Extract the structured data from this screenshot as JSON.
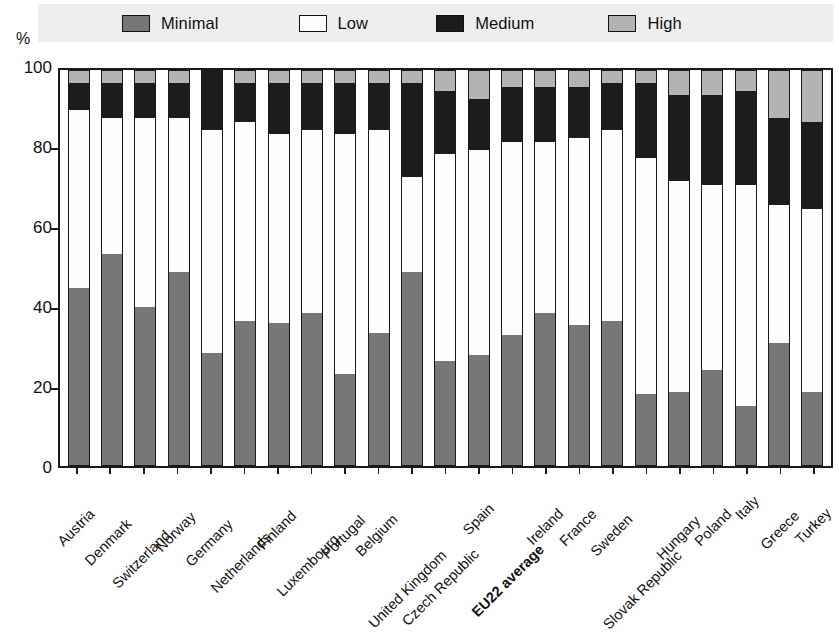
{
  "chart_data": {
    "type": "bar",
    "subtype": "stacked-bar-100",
    "title": "",
    "xlabel": "",
    "ylabel": "%",
    "ylim": [
      0,
      100
    ],
    "yticks": [
      0,
      20,
      40,
      60,
      80,
      100
    ],
    "ytick_labels": [
      "0",
      "20",
      "40",
      "60",
      "80",
      "100"
    ],
    "grid": true,
    "legend_position": "top",
    "stack_order_bottom_to_top": [
      "Minimal",
      "Low",
      "Medium",
      "High"
    ],
    "categories": [
      "Austria",
      "Denmark",
      "Switzerland",
      "Norway",
      "Germany",
      "Netherlands",
      "Finland",
      "Luxembourg",
      "Portugal",
      "Belgium",
      "United Kingdom",
      "Czech Republic",
      "Spain",
      "EU22 average",
      "Ireland",
      "France",
      "Sweden",
      "Slovak Republic",
      "Hungary",
      "Poland",
      "Italy",
      "Greece",
      "Turkey"
    ],
    "highlighted_categories": [
      "EU22 average"
    ],
    "series": [
      {
        "name": "Minimal",
        "color": "#777777",
        "values": [
          45,
          53.5,
          40,
          49,
          28.5,
          36.5,
          36,
          38.5,
          23,
          33.5,
          49,
          26.5,
          28,
          33,
          38.5,
          35.5,
          36.5,
          18,
          18.5,
          24,
          15,
          31,
          18.5
        ]
      },
      {
        "name": "Low",
        "color": "#ffffff",
        "values": [
          45,
          34.5,
          48,
          39,
          56.5,
          50.5,
          48,
          46.5,
          61,
          51.5,
          24,
          52.5,
          52,
          49,
          43.5,
          47.5,
          48.5,
          60,
          53.5,
          47,
          56,
          35,
          46.5
        ]
      },
      {
        "name": "Medium",
        "color": "#1c1c1c",
        "values": [
          7,
          9,
          9,
          9,
          15,
          10,
          13,
          12,
          13,
          12,
          24,
          16,
          13,
          14,
          14,
          13,
          12,
          19,
          22,
          23,
          24,
          22,
          22
        ]
      },
      {
        "name": "High",
        "color": "#b3b3b3",
        "values": [
          3,
          3,
          3,
          3,
          0,
          3,
          3,
          3,
          3,
          3,
          3,
          5,
          7,
          4,
          4,
          4,
          3,
          3,
          6,
          6,
          5,
          12,
          13
        ]
      }
    ]
  },
  "legend": {
    "items": [
      {
        "label": "Minimal",
        "swatch": "#777777"
      },
      {
        "label": "Low",
        "swatch": "#ffffff"
      },
      {
        "label": "Medium",
        "swatch": "#1c1c1c"
      },
      {
        "label": "High",
        "swatch": "#b3b3b3"
      }
    ]
  },
  "axis": {
    "y_unit": "%"
  }
}
